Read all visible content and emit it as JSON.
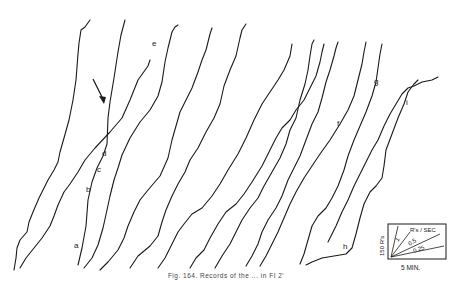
{
  "figure": {
    "caption": "Fig. 164. Records of the ... in FI 2'",
    "curve_labels": [
      "a",
      "b",
      "c",
      "d",
      "e",
      "f",
      "g",
      "h",
      "i"
    ],
    "arrow": "arrow pointing to curve at d"
  },
  "legend": {
    "y_scale": "150 R's",
    "x_scale": "5 MIN.",
    "rate_title": "R's / SEC",
    "rates": [
      "1",
      "0.5",
      "0.25"
    ]
  }
}
